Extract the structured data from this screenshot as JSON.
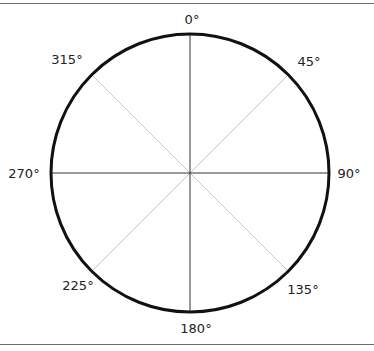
{
  "diagram": {
    "type": "compass-circle",
    "center": [
      190,
      173
    ],
    "radius": 139,
    "colors": {
      "circle": "#111111",
      "axis": "#333333",
      "diagonal": "#c8c8c8",
      "rule": "#6a6a6a"
    },
    "labels": {
      "deg0": "0°",
      "deg45": "45°",
      "deg90": "90°",
      "deg135": "135°",
      "deg180": "180°",
      "deg225": "225°",
      "deg270": "270°",
      "deg315": "315°"
    }
  }
}
